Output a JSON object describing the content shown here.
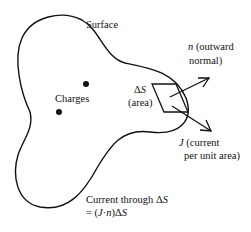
{
  "diagram": {
    "surface_label": "Surface",
    "charges_label": "Charges",
    "delta_s": {
      "symbol": "Δ",
      "var": "S",
      "note": "(area)"
    },
    "normal": {
      "var": "n",
      "line1_rest": " (outward",
      "line2": "normal)"
    },
    "current": {
      "var": "J",
      "line1_rest": " (current",
      "line2": "per unit area)"
    },
    "flux": {
      "line1_text": "Current through Δ",
      "line1_var": "S",
      "line2_prefix": "= (",
      "line2_J": "J",
      "line2_dot": "·",
      "line2_n": "n",
      "line2_close": ")Δ",
      "line2_S": "S"
    },
    "colors": {
      "stroke": "#111111",
      "background": "#ffffff"
    }
  }
}
